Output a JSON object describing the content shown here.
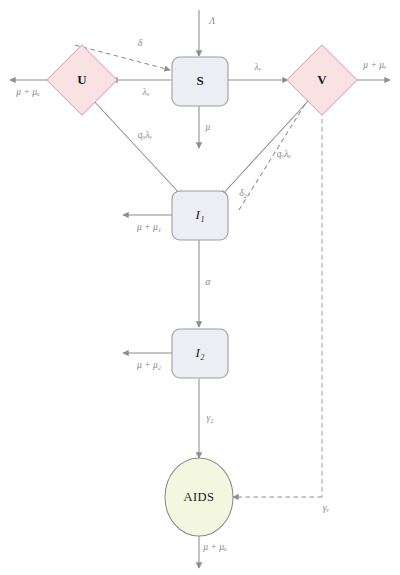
{
  "diagram": {
    "colors": {
      "box_fill": "#eceef4",
      "box_stroke": "#9b9ba3",
      "diamond_fill": "#fae2e4",
      "diamond_stroke": "#d9a9b4",
      "ellipse_fill": "#f3f7e0",
      "ellipse_stroke": "#8c8c8c",
      "edge_stroke": "#8d8d93",
      "edge_label": "#8a8a8a",
      "node_label": "#1a1a1a"
    },
    "nodes": [
      {
        "id": "S",
        "label": "S",
        "shape": "rounded-box"
      },
      {
        "id": "U",
        "label": "U",
        "shape": "diamond"
      },
      {
        "id": "V",
        "label": "V",
        "shape": "diamond"
      },
      {
        "id": "I1",
        "label": "I₁",
        "shape": "rounded-box"
      },
      {
        "id": "I2",
        "label": "I₂",
        "shape": "rounded-box"
      },
      {
        "id": "AIDS",
        "label": "AIDS",
        "shape": "ellipse"
      }
    ],
    "edge_labels": {
      "inflow_lambda": "Λ",
      "s_to_u": "λᵤ",
      "s_to_v": "λᵥ",
      "s_death": "μ",
      "u_death": "μ + μᵤ",
      "v_death": "μ + μᵥ",
      "u_to_i1": "qᵤλᵥ",
      "v_to_i1": "qᵥλᵤ",
      "u_feedback_delta": "δ",
      "i1_to_v_delta2": "δ₂",
      "i1_death": "μ + μ₁",
      "i1_to_i2": "α",
      "i2_death": "μ + μ₂",
      "i2_to_aids": "γ₂",
      "v_to_aids": "γᵥ",
      "aids_death": "μ + μₐ"
    }
  }
}
